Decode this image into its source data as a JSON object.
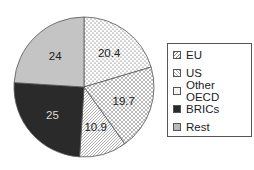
{
  "chart_data": {
    "type": "pie",
    "title": "",
    "categories": [
      "Other OECD",
      "US",
      "EU",
      "BRICs",
      "Rest"
    ],
    "values": [
      20.4,
      19.7,
      10.9,
      25,
      24
    ],
    "slices": [
      {
        "label": "Other OECD",
        "value": 20.4,
        "pattern": "dots",
        "color": "#ffffff",
        "text_color": "#222222"
      },
      {
        "label": "US",
        "value": 19.7,
        "pattern": "crosshatch",
        "color": "#ffffff",
        "text_color": "#222222"
      },
      {
        "label": "EU",
        "value": 10.9,
        "pattern": "diagonal",
        "color": "#ffffff",
        "text_color": "#222222"
      },
      {
        "label": "BRICs",
        "value": 25,
        "pattern": "solid",
        "color": "#2a2a2a",
        "text_color": "#dddddd"
      },
      {
        "label": "Rest",
        "value": 24,
        "pattern": "solid",
        "color": "#c4c4c4",
        "text_color": "#222222"
      }
    ],
    "legend": {
      "position": "right",
      "entries": [
        "EU",
        "US",
        "Other OECD",
        "BRICs",
        "Rest"
      ]
    },
    "start_angle": "12 o'clock",
    "direction": "clockwise"
  },
  "legend": {
    "items": [
      {
        "label": "EU",
        "pattern": "diagonal"
      },
      {
        "label": "US",
        "pattern": "crosshatch"
      },
      {
        "label": "Other OECD",
        "pattern": "dots"
      },
      {
        "label": "BRICs",
        "pattern": "solid-dark"
      },
      {
        "label": "Rest",
        "pattern": "solid-gray"
      }
    ]
  }
}
